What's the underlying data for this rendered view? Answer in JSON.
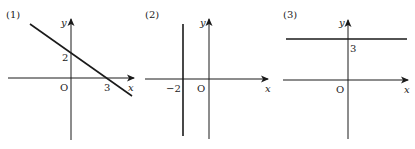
{
  "panels": [
    {
      "label": "(1)",
      "axis_x": "x",
      "axis_y": "y",
      "origin": "O",
      "ticks": {
        "y_intercept": "2",
        "x_intercept": "3"
      },
      "line": {
        "type": "slanted",
        "description": "line through (0,2) and (3,0)"
      }
    },
    {
      "label": "(2)",
      "axis_x": "x",
      "axis_y": "y",
      "origin": "O",
      "ticks": {
        "x_value": "−2"
      },
      "line": {
        "type": "vertical",
        "description": "x = -2"
      }
    },
    {
      "label": "(3)",
      "axis_x": "x",
      "axis_y": "y",
      "origin": "O",
      "ticks": {
        "y_value": "3"
      },
      "line": {
        "type": "horizontal",
        "description": "y = 3"
      }
    }
  ],
  "colors": {
    "ink": "#1a1a1a",
    "background": "#ffffff"
  }
}
